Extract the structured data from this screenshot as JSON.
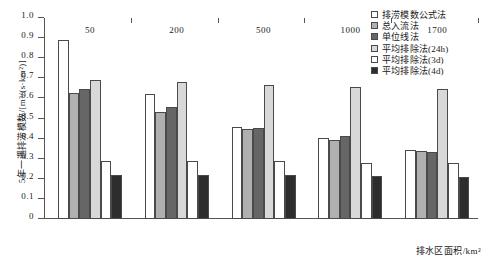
{
  "chart_data": {
    "type": "bar",
    "title": "",
    "xlabel": "排水区面积/km²",
    "ylabel": "5年一遇排涝模数/[m³/(s·km²)]",
    "categories": [
      "50",
      "200",
      "500",
      "1000",
      "1700"
    ],
    "ylim": [
      0,
      1.0
    ],
    "ytick_labels": [
      "0",
      "0.1",
      "0.2",
      "0.3",
      "0.4",
      "0.5",
      "0.6",
      "0.7",
      "0.8",
      "0.9",
      "1.0"
    ],
    "ytick_values": [
      0,
      0.1,
      0.2,
      0.3,
      0.4,
      0.5,
      0.6,
      0.7,
      0.8,
      0.9,
      1.0
    ],
    "grid": false,
    "legend_position": "top-right",
    "series": [
      {
        "name": "排涝模数公式法",
        "color": "#ffffff",
        "values": [
          0.89,
          0.62,
          0.46,
          0.405,
          0.345
        ]
      },
      {
        "name": "总入流法",
        "color": "#b0b0b0",
        "values": [
          0.625,
          0.53,
          0.45,
          0.395,
          0.34
        ]
      },
      {
        "name": "单位线法",
        "color": "#666666",
        "values": [
          0.645,
          0.555,
          0.455,
          0.415,
          0.335
        ]
      },
      {
        "name": "平均排除法(24h)",
        "color": "#d8d8d8",
        "values": [
          0.69,
          0.68,
          0.665,
          0.655,
          0.645
        ]
      },
      {
        "name": "平均排除法(3d)",
        "color": "#ffffff",
        "values": [
          0.29,
          0.29,
          0.29,
          0.28,
          0.28
        ]
      },
      {
        "name": "平均排除法(4d)",
        "color": "#2d2d2d",
        "values": [
          0.22,
          0.22,
          0.22,
          0.215,
          0.21
        ]
      }
    ]
  }
}
